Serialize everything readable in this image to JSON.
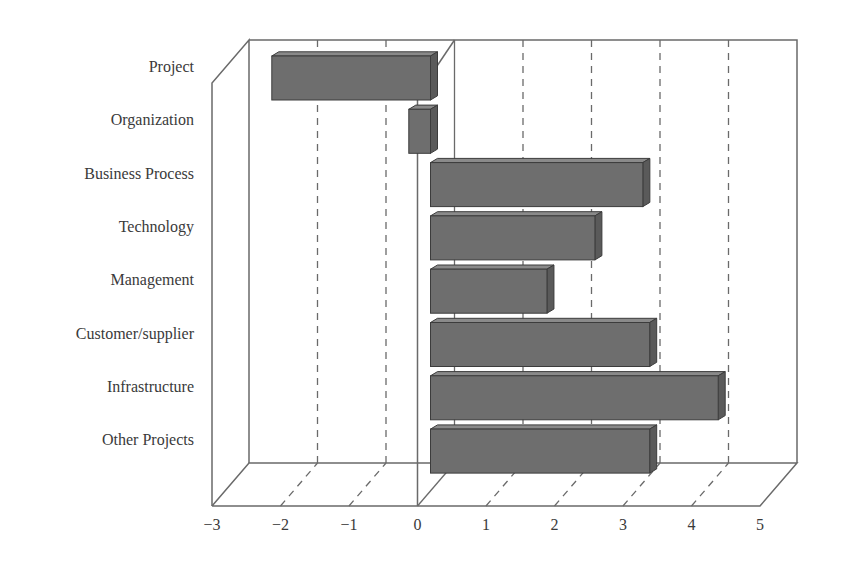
{
  "chart_data": {
    "type": "bar",
    "orientation": "horizontal",
    "style": "3d",
    "title": "",
    "xlabel": "",
    "ylabel": "",
    "categories": [
      "Project",
      "Organization",
      "Business Process",
      "Technology",
      "Management",
      "Customer/supplier",
      "Infrastructure",
      "Other Projects"
    ],
    "values": [
      -2.2,
      -0.2,
      3.1,
      2.4,
      1.7,
      3.2,
      4.2,
      3.2
    ],
    "xlim": [
      -3,
      5
    ],
    "xticks": [
      "−3",
      "−2",
      "−1",
      "0",
      "1",
      "2",
      "3",
      "4",
      "5"
    ],
    "grid": "dashed vertical",
    "legend": null,
    "colors": {
      "bar_front": "#6e6e6e",
      "bar_top": "#8a8a8a",
      "bar_side": "#5a5a5a",
      "bar_edge": "#3c3c3c",
      "axis": "#6a6a6a",
      "text": "#3a3a3a"
    }
  }
}
